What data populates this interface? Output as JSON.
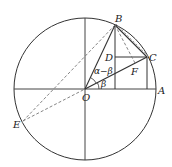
{
  "diagram": {
    "title": "",
    "colors": {
      "stroke": "#333333",
      "dashed": "#777777",
      "text": "#222222"
    },
    "circle": {
      "cx": 85,
      "cy": 89,
      "r": 71
    },
    "points": {
      "O": {
        "x": 85,
        "y": 89
      },
      "A": {
        "x": 156,
        "y": 89
      },
      "B": {
        "x": 115,
        "y": 25
      },
      "C": {
        "x": 147,
        "y": 57
      },
      "D": {
        "x": 115,
        "y": 57
      },
      "F": {
        "x": 135,
        "y": 63
      },
      "E": {
        "x": 23,
        "y": 121
      }
    },
    "labels": {
      "O": "O",
      "A": "A",
      "B": "B",
      "C": "C",
      "D": "D",
      "F": "F",
      "E": "E",
      "angle_alpha_minus_beta": "α−β",
      "angle_beta": "β"
    }
  }
}
